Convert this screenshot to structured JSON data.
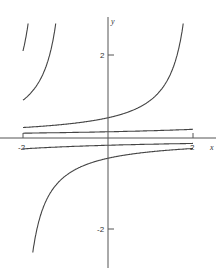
{
  "chart_data": {
    "type": "line",
    "title": "",
    "xlabel": "x",
    "ylabel": "y",
    "xlim": [
      -2,
      2
    ],
    "ylim": [
      -2.7,
      3.0
    ],
    "grid": false,
    "legend": null,
    "x_ticks": [
      {
        "value": -2,
        "label": "-2"
      },
      {
        "value": 2,
        "label": "2"
      }
    ],
    "y_ticks": [
      {
        "value": 2,
        "label": "2"
      },
      {
        "value": -2,
        "label": "-2"
      }
    ],
    "series": [
      {
        "name": "upper C=2.15",
        "C": 2.15,
        "branch": "upper"
      },
      {
        "name": "upper C=-0.85",
        "C": -0.85,
        "branch": "upper"
      },
      {
        "name": "upper C=-1.5",
        "C": -1.5,
        "branch": "upper"
      },
      {
        "name": "upper C=-1.7",
        "C": -1.7,
        "branch": "upper"
      },
      {
        "name": "upper C=-1.8",
        "C": -1.8,
        "branch": "upper"
      },
      {
        "name": "upper near-zero line",
        "C": 7.0,
        "branch": "upper"
      },
      {
        "name": "lower near-zero line",
        "C": -6.0,
        "branch": "lower"
      },
      {
        "name": "lower C=-2.15",
        "C": -2.15,
        "branch": "lower"
      },
      {
        "name": "lower C=0.85",
        "C": 0.85,
        "branch": "lower"
      },
      {
        "name": "lower C=1.5",
        "C": 1.5,
        "branch": "lower"
      },
      {
        "name": "lower C=1.7",
        "C": 1.7,
        "branch": "lower"
      },
      {
        "name": "lower C=1.8",
        "C": 1.8,
        "branch": "lower"
      }
    ]
  },
  "labels": {
    "x_axis": "x",
    "y_axis": "y",
    "x_tick_neg": "-2",
    "x_tick_pos": "2",
    "y_tick_pos": "2",
    "y_tick_neg": "-2"
  }
}
